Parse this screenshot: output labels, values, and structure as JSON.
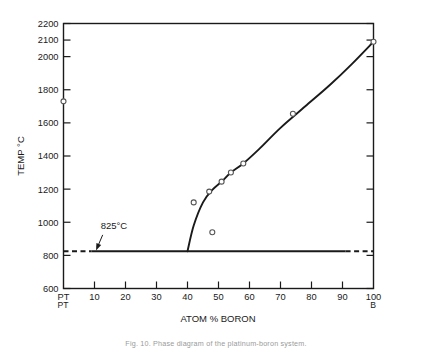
{
  "figure": {
    "caption": "Fig. 10.  Phase diagram of the platinum-boron system.",
    "background_color": "#ffffff",
    "ink_color": "#1a1a1a"
  },
  "chart_data": {
    "type": "line",
    "title": "",
    "xlabel": "ATOM % BORON",
    "ylabel": "TEMP °C",
    "xlim": [
      0,
      100
    ],
    "ylim": [
      600,
      2200
    ],
    "grid": false,
    "legend": "none",
    "x_tick_labels": [
      "PT",
      "10",
      "20",
      "30",
      "40",
      "50",
      "60",
      "70",
      "80",
      "90",
      "100"
    ],
    "x_tick_values": [
      0,
      10,
      20,
      30,
      40,
      50,
      60,
      70,
      80,
      90,
      100
    ],
    "x_end_label_left": "PT",
    "x_end_label_right": "B",
    "y_tick_labels": [
      "600",
      "800",
      "1000",
      "1200",
      "1400",
      "1600",
      "1800",
      "2000",
      "2100",
      "2200"
    ],
    "y_tick_values": [
      600,
      800,
      1000,
      1200,
      1400,
      1600,
      1800,
      2000,
      2100,
      2200
    ],
    "series": [
      {
        "name": "liquidus",
        "type": "line",
        "x": [
          40.0,
          42.0,
          45.0,
          48.0,
          51.0,
          54.0,
          58.0,
          63.0,
          70.0,
          78.0,
          86.0,
          93.0,
          100.0
        ],
        "y": [
          825,
          980,
          1120,
          1195,
          1245,
          1300,
          1355,
          1440,
          1570,
          1700,
          1830,
          1955,
          2090
        ]
      },
      {
        "name": "825 C invariant line",
        "type": "line",
        "x": [
          0,
          100
        ],
        "y": [
          825,
          825
        ],
        "style": "solid-with-dashed-ends",
        "dashed_left_to": 9,
        "dashed_right_from": 91
      }
    ],
    "markers": [
      {
        "x": 0.0,
        "y": 1730,
        "label": "Pt melting point"
      },
      {
        "x": 42.0,
        "y": 1120,
        "label": ""
      },
      {
        "x": 48.0,
        "y": 940,
        "label": ""
      },
      {
        "x": 47.0,
        "y": 1185,
        "label": ""
      },
      {
        "x": 51.0,
        "y": 1245,
        "label": ""
      },
      {
        "x": 54.0,
        "y": 1300,
        "label": ""
      },
      {
        "x": 58.0,
        "y": 1355,
        "label": ""
      },
      {
        "x": 74.0,
        "y": 1655,
        "label": ""
      },
      {
        "x": 100.0,
        "y": 2090,
        "label": ""
      }
    ],
    "annotations": [
      {
        "text": "825°C",
        "x": 12,
        "y": 960,
        "arrow_to_x": 10.5,
        "arrow_to_y": 830
      }
    ]
  }
}
